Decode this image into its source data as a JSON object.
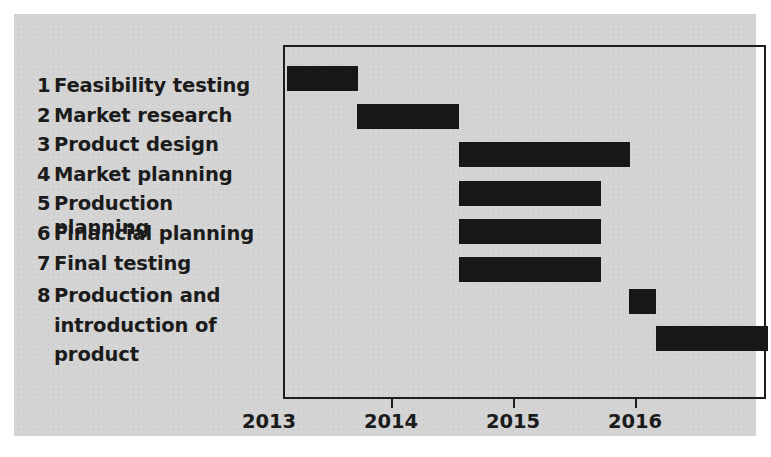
{
  "figure": {
    "background_color": "#d4d4d4",
    "bar_color": "#171717",
    "frame_color": "#1d1d1d"
  },
  "chart_data": {
    "type": "bar",
    "chart_subtype": "gantt",
    "title": "",
    "xlabel": "",
    "ylabel": "",
    "xlim": [
      2013.0,
      2016.96
    ],
    "grid": false,
    "legend": null,
    "axis_ticks": [
      {
        "label": "2013",
        "value": 2013
      },
      {
        "label": "2014",
        "value": 2014
      },
      {
        "label": "2015",
        "value": 2015
      },
      {
        "label": "2016",
        "value": 2016
      }
    ],
    "categories": [
      "Feasibility testing",
      "Market research",
      "Product design",
      "Market planning",
      "Production planning",
      "Financial planning",
      "Final testing",
      "Production and introduction of product"
    ],
    "tasks": [
      {
        "number": "1",
        "name": "Feasibility testing",
        "start": 2013.02,
        "end": 2013.6
      },
      {
        "number": "2",
        "name": "Market research",
        "start": 2013.59,
        "end": 2014.43
      },
      {
        "number": "3",
        "name": "Product design",
        "start": 2014.43,
        "end": 2015.83
      },
      {
        "number": "4",
        "name": "Market planning",
        "start": 2014.43,
        "end": 2015.59
      },
      {
        "number": "5",
        "name": "Production planning",
        "start": 2014.43,
        "end": 2015.59
      },
      {
        "number": "6",
        "name": "Financial planning",
        "start": 2014.43,
        "end": 2015.59
      },
      {
        "number": "7",
        "name": "Final testing",
        "start": 2015.82,
        "end": 2016.04
      },
      {
        "number": "8",
        "name": "Production and\nintroduction of\nproduct",
        "start": 2016.04,
        "end": 2016.96
      }
    ]
  },
  "task_list": [
    {
      "number": "1",
      "label": "Feasibility testing"
    },
    {
      "number": "2",
      "label": "Market research"
    },
    {
      "number": "3",
      "label": "Product design"
    },
    {
      "number": "4",
      "label": "Market planning"
    },
    {
      "number": "5",
      "label": "Production planning"
    },
    {
      "number": "6",
      "label": "Financial planning"
    },
    {
      "number": "7",
      "label": "Final testing"
    },
    {
      "number": "8",
      "label": "Production and\nintroduction of\nproduct"
    }
  ]
}
